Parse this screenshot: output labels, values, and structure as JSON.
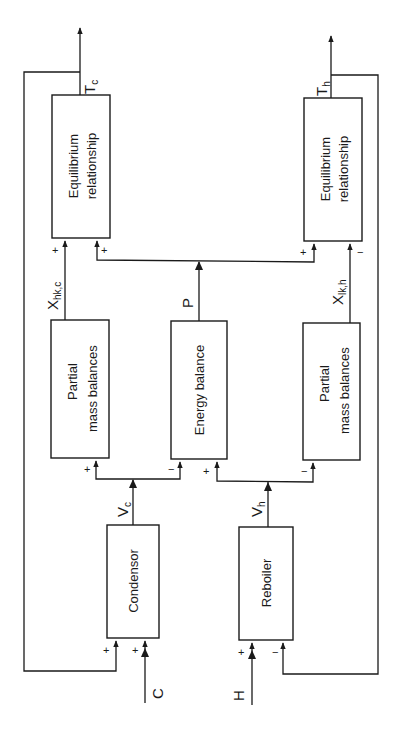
{
  "diagram": {
    "orientation": "rotated 90deg counter-clockwise (signals flow bottom to top)",
    "blocks": {
      "equilibrium_c": {
        "line1": "Equilibrium",
        "line2": "relationship"
      },
      "equilibrium_h": {
        "line1": "Equilibrium",
        "line2": "relationship"
      },
      "partial_mass_c": {
        "line1": "Partial",
        "line2": "mass balances"
      },
      "energy_balance": {
        "line1": "Energy balance"
      },
      "partial_mass_h": {
        "line1": "Partial",
        "line2": "mass balances"
      },
      "condensor": {
        "line1": "Condensor"
      },
      "reboiler": {
        "line1": "Reboiler"
      }
    },
    "signals": {
      "tc": {
        "main": "T",
        "sub": "c"
      },
      "th": {
        "main": "T",
        "sub": "h"
      },
      "xhkc": {
        "main": "X",
        "sub": "hk,c"
      },
      "xlkh": {
        "main": "X",
        "sub": "lk,h"
      },
      "p": {
        "main": "P"
      },
      "vc": {
        "main": "V",
        "sub": "c"
      },
      "vh": {
        "main": "V",
        "sub": "h"
      },
      "c": {
        "main": "C"
      },
      "h": {
        "main": "H"
      }
    },
    "signs": {
      "eq_c_left": "+",
      "eq_c_right": "+",
      "eq_h_left": "+",
      "eq_h_right": "−",
      "pm_c_in": "+",
      "energy_left": "−",
      "energy_right": "+",
      "pm_h_in": "−",
      "cond_fb": "+",
      "cond_c": "+",
      "reb_h": "+",
      "reb_fb": "−"
    }
  }
}
